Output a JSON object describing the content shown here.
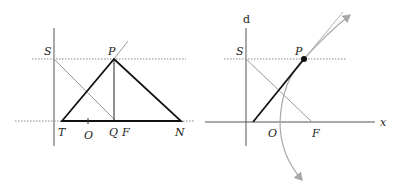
{
  "left_figure": {
    "labels": {
      "S": "S",
      "P": "P",
      "T": "T",
      "O": "O",
      "Q": "Q",
      "F": "F",
      "N": "N"
    }
  },
  "right_figure": {
    "labels": {
      "d": "d",
      "S": "S",
      "P": "P",
      "O": "O",
      "F": "F",
      "x": "x"
    }
  },
  "colors": {
    "primary_line": "#111111",
    "secondary_line": "#9a9a9a",
    "dotted_line": "#888888",
    "arrow_curve": "#a8a8a8"
  }
}
